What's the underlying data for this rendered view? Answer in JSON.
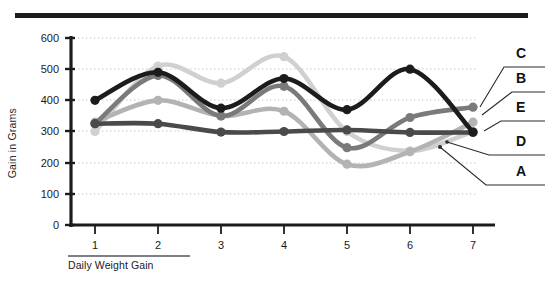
{
  "chart_data": {
    "type": "line",
    "title": "",
    "xlabel": "Daily Weight Gain",
    "ylabel": "Gain in Grams",
    "x": [
      1,
      2,
      3,
      4,
      5,
      6,
      7
    ],
    "xtick_labels": [
      "1",
      "2",
      "3",
      "4",
      "5",
      "6",
      "7"
    ],
    "ytick_labels": [
      "0",
      "100",
      "200",
      "300",
      "400",
      "500",
      "600"
    ],
    "yticks": [
      0,
      100,
      200,
      300,
      400,
      500,
      600
    ],
    "ylim": [
      0,
      600
    ],
    "grid": "horizontal-dotted",
    "legend_position": "right-outside-leader-lines",
    "series": [
      {
        "name": "C",
        "color": "#1c1c1c",
        "values": [
          400,
          490,
          375,
          470,
          370,
          500,
          298
        ]
      },
      {
        "name": "B",
        "color": "#7a7a7a",
        "values": [
          325,
          480,
          350,
          445,
          248,
          345,
          378
        ]
      },
      {
        "name": "E",
        "color": "#b3b3b3",
        "values": [
          330,
          400,
          350,
          365,
          195,
          235,
          330
        ]
      },
      {
        "name": "D",
        "color": "#4a4a4a",
        "values": [
          325,
          325,
          298,
          300,
          305,
          297,
          297
        ]
      },
      {
        "name": "A",
        "color": "#d0d0d0",
        "values": [
          300,
          510,
          455,
          540,
          300,
          238,
          300
        ]
      }
    ],
    "legend_entries": [
      {
        "label": "C",
        "color": "#1c1c1c"
      },
      {
        "label": "B",
        "color": "#7a7a7a"
      },
      {
        "label": "E",
        "color": "#b3b3b3"
      },
      {
        "label": "D",
        "color": "#4a4a4a"
      },
      {
        "label": "A",
        "color": "#d0d0d0"
      }
    ]
  },
  "axis": {
    "y_title": "Gain in Grams",
    "x_title": "Daily Weight Gain",
    "y_0": "0",
    "y_100": "100",
    "y_200": "200",
    "y_300": "300",
    "y_400": "400",
    "y_500": "500",
    "y_600": "600",
    "x_1": "1",
    "x_2": "2",
    "x_3": "3",
    "x_4": "4",
    "x_5": "5",
    "x_6": "6",
    "x_7": "7"
  },
  "legend": {
    "c": "C",
    "b": "B",
    "e": "E",
    "d": "D",
    "a": "A"
  },
  "colors": {
    "axis": "#1c1c1c",
    "grid": "#c8c8d8",
    "series_c": "#1c1c1c",
    "series_b": "#7a7a7a",
    "series_e": "#b3b3b3",
    "series_d": "#4a4a4a",
    "series_a": "#d0d0d0",
    "top_rule": "#1c1c1c"
  }
}
